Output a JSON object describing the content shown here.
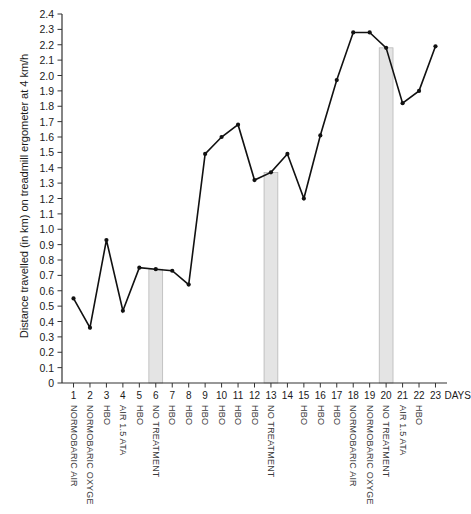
{
  "chart_data": {
    "type": "line",
    "title": "",
    "subtitle": "",
    "xlabel": "DAYS",
    "ylabel": "Distance travelled (in km) on treadmill ergometer at 4 km/h",
    "xlim": [
      0.3,
      23.7
    ],
    "ylim": [
      0,
      2.4
    ],
    "grid": false,
    "legend": "none",
    "x": [
      1,
      2,
      3,
      4,
      5,
      6,
      7,
      8,
      9,
      10,
      11,
      12,
      13,
      14,
      15,
      16,
      17,
      18,
      19,
      20,
      21,
      22,
      23
    ],
    "y_tick_labels": [
      "0",
      "0.1",
      "0.2",
      "0.3",
      "0.4",
      "0.5",
      "0.6",
      "0.7",
      "0.8",
      "0.9",
      "1.0",
      "1.1",
      "1.2",
      "1.3",
      "1.4",
      "1.5",
      "1.6",
      "1.7",
      "1.8",
      "1.9",
      "2.0",
      "2.1",
      "2.2",
      "2.3",
      "2.4"
    ],
    "x_tick_labels": [
      "1",
      "2",
      "3",
      "4",
      "5",
      "6",
      "7",
      "8",
      "9",
      "10",
      "11",
      "12",
      "13",
      "14",
      "15",
      "16",
      "17",
      "18",
      "19",
      "20",
      "21",
      "22",
      "23"
    ],
    "series": [
      {
        "name": "Distance travelled",
        "values": [
          0.55,
          0.36,
          0.93,
          0.47,
          0.75,
          0.74,
          0.73,
          0.64,
          1.49,
          1.6,
          1.68,
          1.32,
          1.37,
          1.49,
          1.2,
          1.61,
          1.97,
          2.28,
          2.28,
          2.18,
          1.82,
          1.9,
          2.19
        ]
      }
    ],
    "shaded_bands": [
      {
        "day": 6,
        "label": "NO TREATMENT",
        "top_value": 0.74
      },
      {
        "day": 13,
        "label": "NO TREATMENT",
        "top_value": 1.37
      },
      {
        "day": 20,
        "label": "NO TREATMENT",
        "top_value": 2.18
      }
    ],
    "treatment_labels": [
      "NORMOBARIC AIR",
      "NORMOBARIC OXYGE",
      "HBO",
      "AIR 1.5 ATA",
      "HBO",
      "NO TREATMENT",
      "HBO",
      "HBO",
      "HBO",
      "HBO",
      "HBO",
      "HBO",
      "NO TREATMENT",
      "",
      "HBO",
      "HBO",
      "HBO",
      "NORMOBARIC AIR",
      "NORMOBARIC OXYGE",
      "NO TREATMENT",
      "AIR 1.5 ATA",
      "HBO",
      ""
    ],
    "colors": {
      "line": "#111111",
      "marker": "#111111",
      "axis": "#333333",
      "band_fill": "#e4e4e4",
      "band_edge": "#b0b0b0",
      "text": "#1a1a1a",
      "label_text": "#3a3a3a",
      "background": "#ffffff"
    }
  }
}
